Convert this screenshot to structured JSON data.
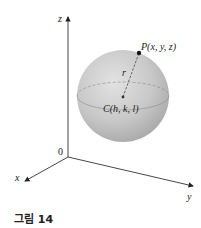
{
  "figure": {
    "caption": "그림 14",
    "axes": {
      "x_label": "x",
      "y_label": "y",
      "z_label": "z",
      "origin_label": "0"
    },
    "sphere": {
      "center_label": "C(h, k, l)",
      "point_label": "P(x, y, z)",
      "radius_label": "r",
      "fill_color": "#c4c4c4"
    }
  }
}
